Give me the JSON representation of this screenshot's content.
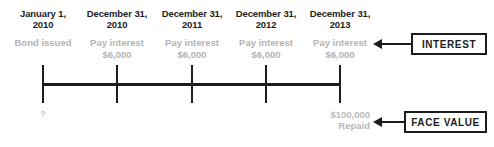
{
  "diagram": {
    "axis": {
      "line_color": "#1d1d1d",
      "tick_color": "#1d1d1d"
    },
    "events": [
      {
        "date_line1": "January 1,",
        "date_line2": "2010",
        "note_line1": "Bond issued",
        "note_line2": "",
        "below_label": "?"
      },
      {
        "date_line1": "December 31,",
        "date_line2": "2010",
        "note_line1": "Pay interest",
        "note_line2": "$6,000",
        "below_label": ""
      },
      {
        "date_line1": "December 31,",
        "date_line2": "2011",
        "note_line1": "Pay interest",
        "note_line2": "$6,000",
        "below_label": ""
      },
      {
        "date_line1": "December 31,",
        "date_line2": "2012",
        "note_line1": "Pay interest",
        "note_line2": "$6,000",
        "below_label": ""
      },
      {
        "date_line1": "December 31,",
        "date_line2": "2013",
        "note_line1": "Pay interest",
        "note_line2": "$6,000",
        "below_label": ""
      }
    ],
    "face_value": {
      "amount": "$100,000",
      "status": "Repaid"
    },
    "callouts": [
      {
        "label": "INTEREST"
      },
      {
        "label": "FACE VALUE"
      }
    ],
    "colors": {
      "ink": "#1d1d1d",
      "muted": "#b3b3b3",
      "faint": "#c9c9c9",
      "background": "#ffffff"
    }
  }
}
